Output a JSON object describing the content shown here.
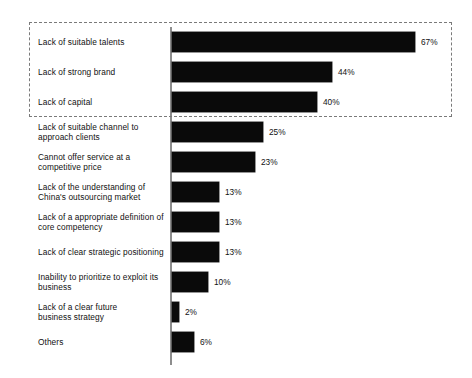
{
  "chart_data": {
    "type": "bar",
    "orientation": "horizontal",
    "title": "",
    "subtitle": "",
    "xlabel": "",
    "ylabel": "",
    "grid": false,
    "legend": null,
    "xlim": [
      0,
      70
    ],
    "value_suffix": "%",
    "categories": [
      "Lack of suitable talents",
      "Lack of strong brand",
      "Lack of capital",
      "Lack of suitable channel to approach clients",
      "Cannot offer service at a competitive price",
      "Lack of the understanding of China's outsourcing market",
      "Lack of a appropriate definition of core competency",
      "Lack of clear strategic positioning",
      "Inability to prioritize to exploit its business",
      "Lack of a clear future business strategy",
      "Others"
    ],
    "values": [
      67,
      44,
      40,
      25,
      23,
      13,
      13,
      13,
      10,
      2,
      6
    ],
    "value_labels": [
      "67%",
      "44%",
      "40%",
      "25%",
      "23%",
      "13%",
      "13%",
      "13%",
      "10%",
      "2%",
      "6%"
    ],
    "bar_color": "#0a0a0a",
    "annotations": [
      {
        "type": "dashed-rectangle",
        "name": "top-three-highlight",
        "covers": [
          "Lack of suitable talents",
          "Lack of strong brand",
          "Lack of capital"
        ],
        "color": "#7a7a7a"
      }
    ]
  },
  "rows": [
    {
      "label_lines": [
        "Lack of suitable talents"
      ],
      "value": 67,
      "value_label": "67%"
    },
    {
      "label_lines": [
        "Lack of strong brand"
      ],
      "value": 44,
      "value_label": "44%"
    },
    {
      "label_lines": [
        "Lack of capital"
      ],
      "value": 40,
      "value_label": "40%"
    },
    {
      "label_lines": [
        "Lack of suitable channel to",
        "approach clients"
      ],
      "value": 25,
      "value_label": "25%"
    },
    {
      "label_lines": [
        "Cannot offer service at a",
        "competitive price"
      ],
      "value": 23,
      "value_label": "23%"
    },
    {
      "label_lines": [
        "Lack of the understanding of",
        "China's outsourcing market"
      ],
      "value": 13,
      "value_label": "13%"
    },
    {
      "label_lines": [
        "Lack of a appropriate definition of",
        "core competency"
      ],
      "value": 13,
      "value_label": "13%"
    },
    {
      "label_lines": [
        "Lack of clear strategic positioning"
      ],
      "value": 13,
      "value_label": "13%"
    },
    {
      "label_lines": [
        "Inability to prioritize to exploit its",
        "business"
      ],
      "value": 10,
      "value_label": "10%"
    },
    {
      "label_lines": [
        "Lack of a clear future",
        "business strategy"
      ],
      "value": 2,
      "value_label": "2%"
    },
    {
      "label_lines": [
        "Others"
      ],
      "value": 6,
      "value_label": "6%"
    }
  ],
  "layout": {
    "row_pitch": 30,
    "first_row_top": 27,
    "bar_origin_x": 172,
    "px_per_percent": 3.63
  }
}
